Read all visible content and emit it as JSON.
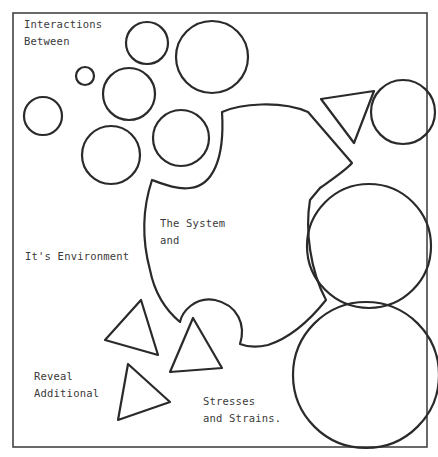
{
  "labels": {
    "interactions_line1": "Interactions",
    "interactions_line2": "Between",
    "system_line1": "The System",
    "system_line2": "and",
    "environment": "It's Environment",
    "reveal_line1": "Reveal",
    "reveal_line2": "Additional",
    "stresses_line1": "Stresses",
    "stresses_line2": "and Strains."
  },
  "colors": {
    "stroke": "#2a2a2a",
    "text": "#3a3a3a",
    "background": "#ffffff"
  }
}
